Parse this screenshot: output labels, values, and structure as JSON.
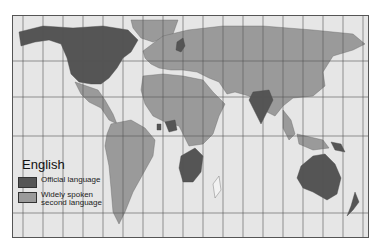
{
  "legend": {
    "title": "English",
    "items": [
      {
        "label": "Official language",
        "color": "#555555"
      },
      {
        "label": "Widely spoken second language",
        "label_line1": "Widely spoken",
        "label_line2": "second language",
        "color": "#9a9a9a"
      }
    ]
  },
  "map": {
    "ocean_color": "#e6e6e6",
    "other_land_color": "#f2f2f2",
    "grid_color": "#555555",
    "official_regions": [
      "USA",
      "Canada",
      "UK",
      "Ireland",
      "India",
      "Australia",
      "New Zealand",
      "South Africa",
      "Nigeria",
      "Ghana",
      "Papua New Guinea",
      "Botswana",
      "Zimbabwe",
      "Namibia"
    ],
    "second_language_regions": [
      "Mexico",
      "Central America",
      "South America",
      "Europe",
      "Russia",
      "Middle East",
      "China",
      "Southeast Asia",
      "Africa"
    ]
  }
}
